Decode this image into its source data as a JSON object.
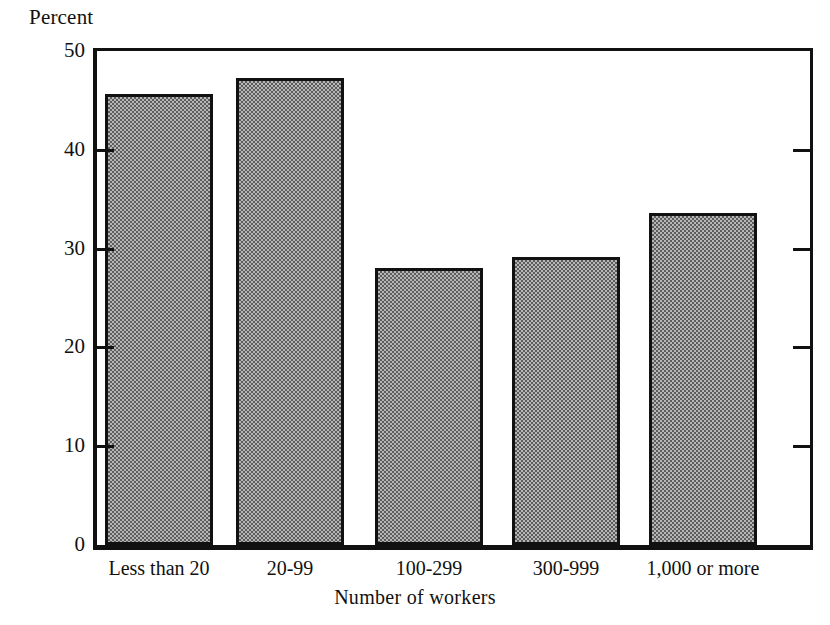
{
  "chart_data": {
    "type": "bar",
    "title": "",
    "xlabel": "Number of workers",
    "ylabel": "Percent",
    "categories": [
      "Less than 20",
      "20-99",
      "100-299",
      "300-999",
      "1,000 or more"
    ],
    "values": [
      45.6,
      47.3,
      28.0,
      29.2,
      33.6
    ],
    "ylim": [
      0,
      50
    ],
    "yticks": [
      0,
      10,
      20,
      30,
      40,
      50
    ],
    "ytick_labels": [
      "0",
      "10",
      "20",
      "30",
      "40",
      "50"
    ],
    "xticks_shown": false,
    "grid": false,
    "legend": false,
    "bar_fill": "#b6b6b6",
    "bar_pattern": "checkerboard-dither",
    "bar_border_color": "#111111",
    "axis_color": "#111111",
    "background": "#ffffff"
  },
  "axes": {
    "y_title": "Percent",
    "x_title": "Number of workers"
  }
}
